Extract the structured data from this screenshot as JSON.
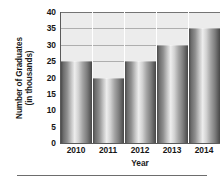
{
  "chart_data": {
    "type": "bar",
    "title": "",
    "xlabel": "Year",
    "ylabel_line1": "Number of Graduates",
    "ylabel_line2": "(in thousands)",
    "categories": [
      "2010",
      "2011",
      "2012",
      "2013",
      "2014"
    ],
    "values": [
      25,
      20,
      25,
      30,
      35
    ],
    "ylim": [
      0,
      40
    ],
    "ytick_values": [
      0,
      5,
      10,
      15,
      20,
      25,
      30,
      35,
      40
    ],
    "ytick_labels": [
      "0",
      "5",
      "10",
      "15",
      "20",
      "25",
      "30",
      "35",
      "40"
    ],
    "grid": true,
    "grid_axis": "y",
    "legend": false,
    "bar_style": "cylindrical-gray-gradient",
    "plot_background": "#ececec",
    "gridline_color": "#9a9a9a",
    "axis_color": "#5a5a5a",
    "bar_gap": 0
  }
}
